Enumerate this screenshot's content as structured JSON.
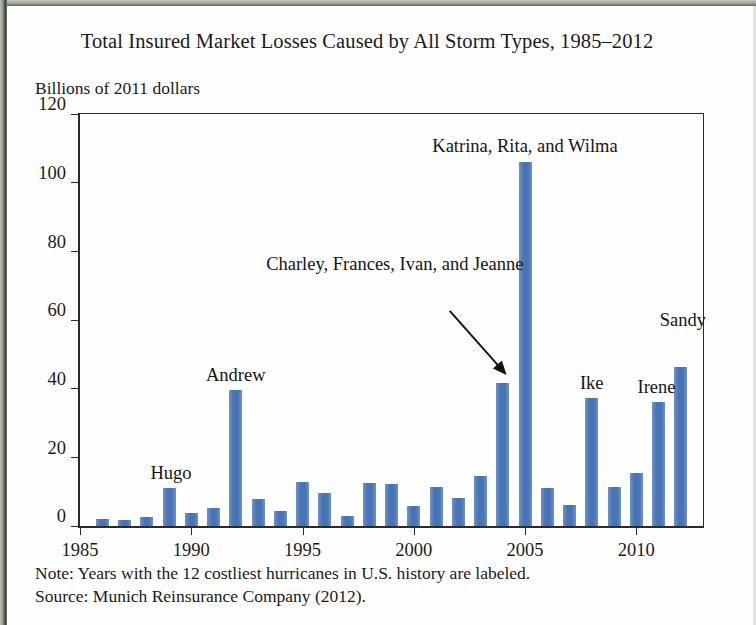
{
  "figure": {
    "title": "Total Insured Market Losses Caused by All Storm Types, 1985–2012",
    "unit_label": "Billions of 2011 dollars",
    "note": "Note: Years with the 12 costliest hurricanes in U.S. history are labeled.",
    "source": "Source: Munich Reinsurance Company (2012).",
    "bar_color": "#4873b4",
    "axis_color": "#2b2b2b"
  },
  "chart_data": {
    "type": "bar",
    "title": "Total Insured Market Losses Caused by All Storm Types, 1985–2012",
    "subtitle": "Billions of 2011 dollars",
    "xlabel": "",
    "ylabel": "Billions of 2011 dollars",
    "xlim": [
      1985,
      2013
    ],
    "ylim": [
      0,
      120
    ],
    "ytick_labels": [
      "0",
      "20",
      "40",
      "60",
      "80",
      "100",
      "120"
    ],
    "ytick_values": [
      0,
      20,
      40,
      60,
      80,
      100,
      120
    ],
    "xtick_labels": [
      "1985",
      "1990",
      "1995",
      "2000",
      "2005",
      "2010"
    ],
    "xtick_values": [
      1985,
      1990,
      1995,
      2000,
      2005,
      2010
    ],
    "grid": false,
    "legend": null,
    "categories": [
      1986,
      1987,
      1988,
      1989,
      1990,
      1991,
      1992,
      1993,
      1994,
      1995,
      1996,
      1997,
      1998,
      1999,
      2000,
      2001,
      2002,
      2003,
      2004,
      2005,
      2006,
      2007,
      2008,
      2009,
      2010,
      2011,
      2012
    ],
    "values": [
      2.0,
      1.8,
      2.5,
      11.0,
      3.8,
      5.2,
      39.5,
      7.8,
      4.3,
      12.9,
      9.6,
      3.0,
      12.6,
      12.1,
      5.8,
      11.4,
      8.3,
      14.6,
      41.7,
      106.0,
      11.0,
      6.2,
      37.3,
      11.3,
      15.4,
      36.1,
      46.3
    ],
    "annotations": [
      {
        "text": "Hugo",
        "year": 1989,
        "value": 11.0
      },
      {
        "text": "Andrew",
        "year": 1992,
        "value": 39.5
      },
      {
        "text": "Charley, Frances, Ivan, and Jeanne",
        "year": 2004,
        "value": 41.7
      },
      {
        "text": "Katrina, Rita, and Wilma",
        "year": 2005,
        "value": 106.0
      },
      {
        "text": "Ike",
        "year": 2008,
        "value": 37.3
      },
      {
        "text": "Irene",
        "year": 2011,
        "value": 36.1
      },
      {
        "text": "Sandy",
        "year": 2012,
        "value": 46.3
      }
    ]
  }
}
